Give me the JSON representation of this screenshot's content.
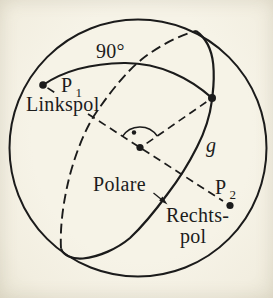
{
  "figure": {
    "description_colors": {
      "ink": "#1b1b1b",
      "paper": "#f4f1e5"
    },
    "labels": {
      "angle": "90°",
      "p1": {
        "base": "P",
        "sub": "1"
      },
      "left_pole": "Linkspol",
      "polar": "Polare",
      "line_g": "g",
      "p2": {
        "base": "P",
        "sub": "2"
      },
      "right_pole_line1": "Rechts-",
      "right_pole_line2": "pol"
    }
  }
}
